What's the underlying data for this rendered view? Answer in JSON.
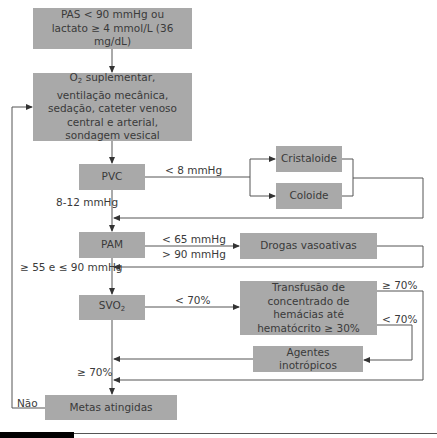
{
  "flowchart": {
    "nodes": {
      "start": "PAS < 90 mmHg ou lactato ≥ 4 mmol/L (36 mg/dL)",
      "start_line1": "PAS < 90 mmHg ou",
      "start_line2": "lactato ≥ 4 mmol/L (36 mg/dL)",
      "support_prefix": "O",
      "support_sub": "2",
      "support_rest": " suplementar, ventilação mecânica, sedação, cateter venoso central e arterial, sondagem vesical",
      "pvc": "PVC",
      "cristaloide": "Cristaloide",
      "coloide": "Coloide",
      "pam": "PAM",
      "drogas": "Drogas vasoativas",
      "svo2_prefix": "SVO",
      "svo2_sub": "2",
      "transfusao": "Transfusão de concentrado de hemácias até hematócrito ≥ 30%",
      "agentes": "Agentes inotrópicos",
      "metas": "Metas atingidas"
    },
    "edge_labels": {
      "pvc_low": "< 8 mmHg",
      "pvc_ok": "8-12 mmHg",
      "pam_low": "< 65 mmHg",
      "pam_high": "> 90 mmHg",
      "pam_ok": "≥ 55 e ≤ 90 mmHg",
      "svo2_low": "< 70%",
      "transf_ok": "≥ 70%",
      "transf_low": "< 70%",
      "svo2_ok": "≥ 70%",
      "nao": "Não"
    }
  },
  "colors": {
    "box_fill": "#a9a9a9",
    "line": "#555555",
    "text": "#3a3a3a"
  }
}
